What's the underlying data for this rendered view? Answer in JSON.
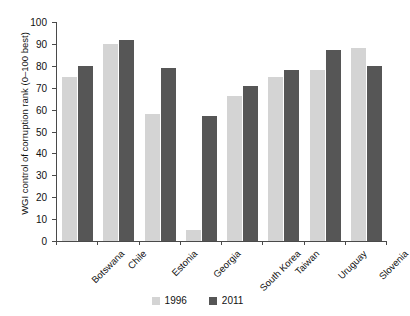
{
  "chart_data": {
    "type": "bar",
    "title": "",
    "subtitle": "",
    "xlabel": "",
    "ylabel": "WGI control of corruption rank (0–100 best)",
    "ylim": [
      0,
      100
    ],
    "ytick_step": 10,
    "yticks": [
      0,
      10,
      20,
      30,
      40,
      50,
      60,
      70,
      80,
      90,
      100
    ],
    "grid": false,
    "legend_position": "bottom-center",
    "categories": [
      "Botswana",
      "Chile",
      "Estonia",
      "Georgia",
      "South Korea",
      "Taiwan",
      "Uruguay",
      "Slovenia"
    ],
    "series": [
      {
        "name": "1996",
        "color": "#d4d4d4",
        "values": [
          75,
          90,
          58,
          5,
          66,
          75,
          78,
          88
        ]
      },
      {
        "name": "2011",
        "color": "#565656",
        "values": [
          80,
          92,
          79,
          57,
          71,
          78,
          87,
          80
        ]
      }
    ],
    "annotations": []
  },
  "legend": {
    "items": [
      {
        "label": "1996",
        "color": "#d4d4d4"
      },
      {
        "label": "2011",
        "color": "#565656"
      }
    ]
  },
  "axis": {
    "color": "#4a4a4a"
  }
}
